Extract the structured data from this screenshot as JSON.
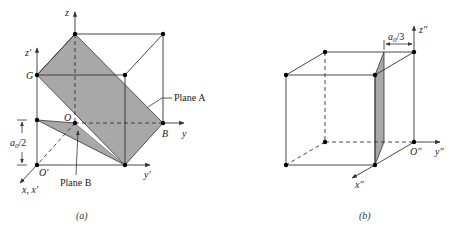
{
  "panel_a": {
    "caption": "(a)",
    "labels": {
      "z": "z",
      "z_prime": "z′",
      "G": "G",
      "O": "O",
      "B": "B",
      "y": "y",
      "y_prime": "y′",
      "O_prime": "O′",
      "x_xprime": "x, x′",
      "a0_half_base": "a",
      "a0_half_sub": "0",
      "a0_half_rest": "/2",
      "plane_a": "Plane A",
      "plane_b": "Plane B"
    }
  },
  "panel_b": {
    "caption": "(b)",
    "labels": {
      "z_dprime": "z″",
      "y_dprime": "y″",
      "x_dprime": "x″",
      "O_dprime": "O″",
      "a0_third_base": "a",
      "a0_third_sub": "0",
      "a0_third_rest": "/3"
    }
  },
  "colors": {
    "plane_fill": "#a8a8a8",
    "line": "#333333",
    "point": "#000000"
  }
}
